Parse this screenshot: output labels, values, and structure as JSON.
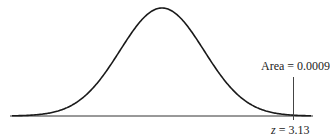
{
  "chart_data": {
    "type": "line",
    "title": "",
    "distribution": {
      "mean": 0,
      "sd": 1
    },
    "annotations": {
      "area_label": "Area = 0.0009",
      "z_label_var": "z",
      "z_label_value": "= 3.13",
      "z_value": 3.13,
      "tail_area": 0.0009
    },
    "xlabel": "",
    "ylabel": "",
    "grid": false,
    "axis_range_z": [
      -3.6,
      3.6
    ]
  }
}
